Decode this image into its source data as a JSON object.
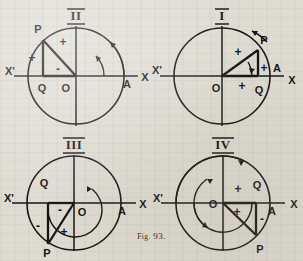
{
  "figure": {
    "caption_prefix": "Fig.",
    "caption_number": "93.",
    "caption_full": "Fig. 93."
  },
  "quadrants": [
    {
      "id": "quadrant-2",
      "roman": "II",
      "position": "top-left",
      "labels": {
        "origin": "O",
        "point": "P",
        "foot": "Q",
        "initial": "A",
        "axis_right": "X",
        "axis_left": "X'"
      },
      "signs": {
        "hypotenuse": "+",
        "vertical_leg": "+",
        "horizontal_leg": "-"
      },
      "sign_list": [
        "+",
        "+",
        "-"
      ],
      "arcs": 2,
      "rotation": "counterclockwise"
    },
    {
      "id": "quadrant-1",
      "roman": "I",
      "position": "top-right",
      "labels": {
        "origin": "O",
        "point": "P",
        "foot": "Q",
        "initial": "A",
        "axis_right": "X",
        "axis_left": "X'"
      },
      "signs": {
        "hypotenuse": "+",
        "vertical_leg": "+",
        "horizontal_leg": "+"
      },
      "sign_list": [
        "+",
        "+",
        "+"
      ],
      "arcs": 1,
      "rotation": "counterclockwise"
    },
    {
      "id": "quadrant-3",
      "roman": "III",
      "position": "bottom-left",
      "labels": {
        "origin": "O",
        "point": "P",
        "foot": "Q",
        "initial": "A",
        "axis_right": "X",
        "axis_left": "X'"
      },
      "signs": {
        "hypotenuse": "+",
        "vertical_leg": "-",
        "horizontal_leg": "-"
      },
      "sign_list": [
        "-",
        "-",
        "+"
      ],
      "arcs": 1,
      "rotation": "counterclockwise"
    },
    {
      "id": "quadrant-4",
      "roman": "IV",
      "position": "bottom-right",
      "labels": {
        "origin": "O",
        "point": "P",
        "foot": "Q",
        "initial": "A",
        "axis_right": "X",
        "axis_left": "X'"
      },
      "signs": {
        "hypotenuse": "+",
        "vertical_leg": "-",
        "horizontal_leg": "+"
      },
      "sign_list": [
        "+",
        "+",
        "-"
      ],
      "arcs": 3,
      "rotation": "counterclockwise"
    }
  ],
  "colors": {
    "ink": "#141210",
    "paper": "#dedbd2"
  }
}
